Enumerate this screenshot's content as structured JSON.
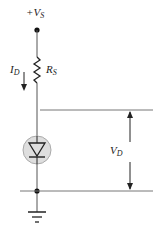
{
  "diagram": {
    "type": "circuit",
    "labels": {
      "supply_prefix": "+",
      "supply_main": "V",
      "supply_sub": "S",
      "resistor_main": "R",
      "resistor_sub": "S",
      "current_main": "I",
      "current_sub": "D",
      "voltage_main": "V",
      "voltage_sub": "D"
    },
    "components": [
      "supply-terminal",
      "resistor",
      "diode",
      "ground"
    ],
    "colors": {
      "wire": "#555555",
      "diode_fill": "#dedede",
      "diode_ring": "#aaaaaa"
    }
  }
}
